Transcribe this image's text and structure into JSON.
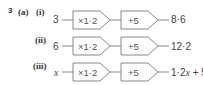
{
  "question": {
    "number": "3",
    "part": "(a)",
    "rows": [
      {
        "sub": "(i)",
        "input": "3",
        "ops": [
          "×1·2",
          "+5"
        ],
        "output": "8·6"
      },
      {
        "sub": "(ii)",
        "input": "6",
        "ops": [
          "×1·2",
          "+5"
        ],
        "output": "12·2"
      },
      {
        "sub": "(iii)",
        "input": "x",
        "ops": [
          "×1·2",
          "+5"
        ],
        "output_prefix": "1·2",
        "output_var": "x",
        "output_suffix": " + 5"
      }
    ]
  },
  "colors": {
    "stroke": "#7a7a7a",
    "text": "#444444"
  }
}
